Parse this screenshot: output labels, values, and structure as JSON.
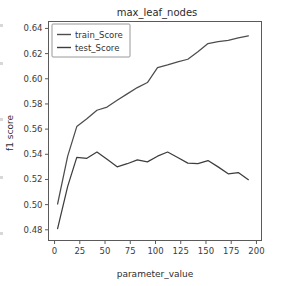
{
  "figure": {
    "width": 286,
    "height": 286,
    "background": "#ffffff"
  },
  "chart_data": {
    "type": "line",
    "title": "max_leaf_nodes",
    "xlabel": "parameter_value",
    "ylabel": "f1 score",
    "xlim": [
      -6,
      205
    ],
    "ylim": [
      0.4715,
      0.6455
    ],
    "xticks": [
      0,
      25,
      50,
      75,
      100,
      125,
      150,
      175,
      200
    ],
    "xtick_labels": [
      "0",
      "25",
      "50",
      "75",
      "100",
      "125",
      "150",
      "175",
      "200"
    ],
    "yticks": [
      0.48,
      0.5,
      0.52,
      0.54,
      0.56,
      0.58,
      0.6,
      0.62,
      0.64
    ],
    "ytick_labels": [
      "0.48",
      "0.50",
      "0.52",
      "0.54",
      "0.56",
      "0.58",
      "0.60",
      "0.62",
      "0.64"
    ],
    "grid": false,
    "legend_position": "upper left",
    "x": [
      3,
      13,
      22,
      32,
      42,
      52,
      62,
      72,
      82,
      92,
      102,
      112,
      122,
      132,
      142,
      152,
      162,
      172,
      182,
      192
    ],
    "series": [
      {
        "name": "train_Score",
        "color": "#4d4d4d",
        "values": [
          0.5005,
          0.5385,
          0.562,
          0.5682,
          0.575,
          0.5775,
          0.583,
          0.588,
          0.593,
          0.597,
          0.6088,
          0.611,
          0.6135,
          0.6155,
          0.6215,
          0.628,
          0.6295,
          0.6305,
          0.6325,
          0.634
        ]
      },
      {
        "name": "test_Score",
        "color": "#3d3d3d",
        "values": [
          0.481,
          0.5145,
          0.5375,
          0.5368,
          0.5418,
          0.536,
          0.53,
          0.5325,
          0.5355,
          0.534,
          0.5385,
          0.5418,
          0.5375,
          0.533,
          0.5325,
          0.535,
          0.53,
          0.5245,
          0.5255,
          0.5198
        ]
      }
    ]
  },
  "legend": {
    "entries": [
      {
        "label": "train_Score"
      },
      {
        "label": "test_Score"
      }
    ]
  }
}
